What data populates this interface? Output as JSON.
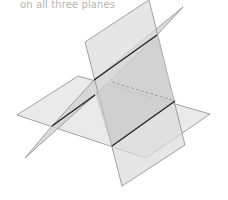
{
  "caption": "on all three planes",
  "colors": {
    "plane_fill": "#e4e4e4",
    "overlap_fill": "#c8c8c8",
    "edge": "#8c8c8c",
    "intersection": "#1e1e1e",
    "caption": "#b4b4b4"
  }
}
